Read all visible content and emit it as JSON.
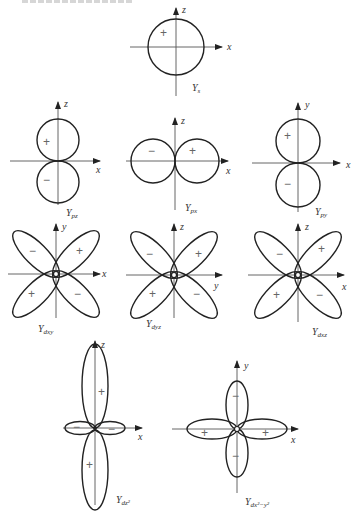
{
  "figure": {
    "header_partial": "",
    "orbitals": [
      {
        "id": "s",
        "label": "Y",
        "subscript": "s",
        "axes": [
          "x",
          "z"
        ],
        "signs": [
          "+"
        ]
      },
      {
        "id": "pz",
        "label": "Y",
        "subscript": "pz",
        "axes": [
          "x",
          "z"
        ],
        "signs": [
          "+",
          "−"
        ]
      },
      {
        "id": "px",
        "label": "Y",
        "subscript": "px",
        "axes": [
          "x",
          "z"
        ],
        "signs": [
          "−",
          "+"
        ]
      },
      {
        "id": "py",
        "label": "Y",
        "subscript": "py",
        "axes": [
          "x",
          "y"
        ],
        "signs": [
          "+",
          "−"
        ]
      },
      {
        "id": "dxy",
        "label": "Y",
        "subscript": "dxy",
        "axes": [
          "x",
          "y"
        ],
        "signs": [
          "−",
          "+",
          "+",
          "−"
        ]
      },
      {
        "id": "dyz",
        "label": "Y",
        "subscript": "dyz",
        "axes": [
          "y",
          "z"
        ],
        "signs": [
          "−",
          "+",
          "+",
          "−"
        ]
      },
      {
        "id": "dxz",
        "label": "Y",
        "subscript": "dxz",
        "axes": [
          "x",
          "z"
        ],
        "signs": [
          "−",
          "+",
          "+",
          "−"
        ]
      },
      {
        "id": "dz2",
        "label": "Y",
        "subscript": "dz²",
        "axes": [
          "x",
          "z"
        ],
        "signs": [
          "+",
          "−",
          "−",
          "+"
        ]
      },
      {
        "id": "dx2y2",
        "label": "Y",
        "subscript": "dx²−y²",
        "axes": [
          "x",
          "y"
        ],
        "signs": [
          "−",
          "+",
          "+",
          "−"
        ]
      }
    ]
  }
}
